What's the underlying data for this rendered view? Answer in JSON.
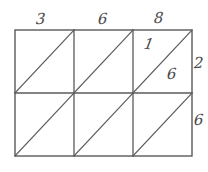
{
  "diagram": {
    "stroke_color": "#5a5a5a",
    "label_color": "#4a4a4a",
    "background_color": "#ffffff",
    "grid": {
      "columns": 3,
      "rows": 2,
      "left": 15,
      "top": 30,
      "right": 192,
      "bottom": 156,
      "vertical_dividers": [
        74,
        133
      ],
      "horizontal_dividers": [
        93
      ],
      "diagonal_direction": "bottom-left-to-top-right"
    },
    "labels": {
      "top_col1": "3",
      "top_col2": "6",
      "top_col3": "8",
      "right_row1": "2",
      "right_row2": "6",
      "inner_upper_left": "1",
      "inner_lower_right": "6"
    }
  }
}
